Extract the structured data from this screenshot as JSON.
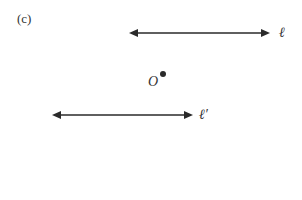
{
  "figure": {
    "panel_label": "(c)",
    "line_l": {
      "label": "ℓ",
      "x1": 129,
      "x2": 270,
      "y": 33
    },
    "line_l_prime": {
      "label": "ℓ′",
      "x1": 52,
      "x2": 193,
      "y": 115
    },
    "point_o": {
      "label": "O",
      "cx": 163,
      "cy": 74
    },
    "stroke_color": "#2a2a2a"
  }
}
